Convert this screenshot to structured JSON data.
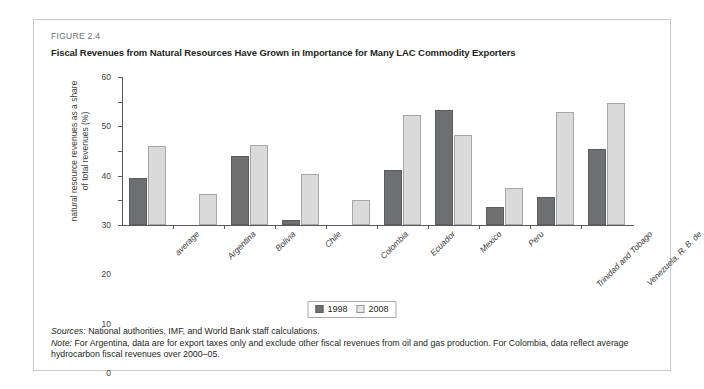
{
  "figure": {
    "label": "FIGURE 2.4",
    "title": "Fiscal Revenues from Natural Resources Have Grown in Importance for Many LAC Commodity Exporters"
  },
  "notes": {
    "sources_lead": "Sources:",
    "sources_text": " National authorities, IMF, and World Bank staff calculations.",
    "note_lead": "Note:",
    "note_text": " For Argentina, data are for export taxes only and exclude other fiscal revenues from oil and gas production. For Colombia, data reflect average hydrocarbon fiscal revenues over 2000–05."
  },
  "legend": {
    "position": "bottom-center",
    "items": [
      {
        "label": "1998",
        "color": "#6e6f71"
      },
      {
        "label": "2008",
        "color": "#dadada"
      }
    ]
  },
  "chart_data": {
    "type": "bar",
    "title": "Fiscal Revenues from Natural Resources Have Grown in Importance for Many LAC Commodity Exporters",
    "xlabel": "",
    "ylabel": "natural resource revenues as a share of total revenues (%)",
    "ylim": [
      0,
      60
    ],
    "yticks": [
      0,
      10,
      20,
      30,
      40,
      50,
      60
    ],
    "grid": false,
    "categories": [
      "average",
      "Argentina",
      "Bolivia",
      "Chile",
      "Colombia",
      "Ecuador",
      "Mexico",
      "Peru",
      "Trinidad and Tobago",
      "Venezuela, R. B. de"
    ],
    "series": [
      {
        "name": "1998",
        "color": "#6e6f71",
        "values": [
          19,
          0,
          28,
          2,
          0,
          22.5,
          46.5,
          7.5,
          11.5,
          31
        ]
      },
      {
        "name": "2008",
        "color": "#dadada",
        "values": [
          32,
          12.5,
          32.5,
          20.5,
          10,
          44.5,
          36.5,
          15,
          46,
          49.5
        ]
      }
    ]
  }
}
